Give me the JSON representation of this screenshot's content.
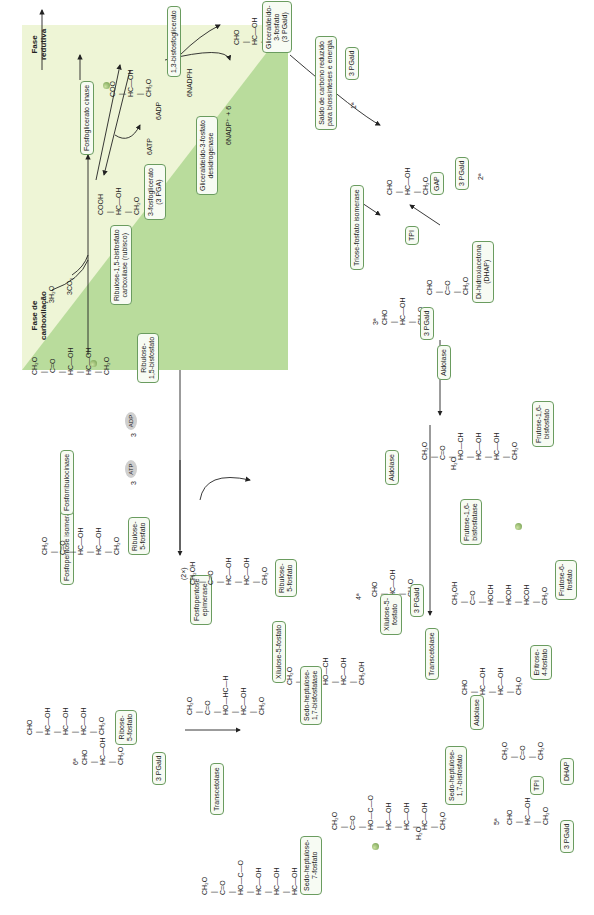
{
  "phases": {
    "carboxylation": "Fase de\ncarboxilação",
    "reduction": "Fase\nredutiva"
  },
  "enzymes": {
    "rubisco": "Ribulose-1,5-bisfosfato\ncarboxilase (rubisco)",
    "phosphoglycerate_kinase": "Fosfoglicerato cinase",
    "gapdh": "Gliceraldeído-3-fosfato\ndesidrogenase",
    "tpi_full": "Triose-fosfato isomerase",
    "tpi": "TPI",
    "tpi_2": "TPI",
    "aldolase_1": "Aldolase",
    "aldolase_2": "Aldolase",
    "aldolase_3": "Aldolase",
    "fbpase": "Frutose-1,6-\nbisfosfatase",
    "transketolase_1": "Transcetolase",
    "transketolase_2": "Transcetolase",
    "sbpase": "Sedo-heptulose-\n1,7-bisfosfatase",
    "epimerase": "Fosfopentose\nepimerase",
    "isomerase": "Fosfopentose isomerase",
    "phosphoribulokinase": "Fosforribulocinase"
  },
  "compounds": {
    "rubp": "Ribulose-\n1,5-bisfosfato",
    "pga": "3-fosfoglicerato\n(3 PGA)",
    "bpg": "1,3-bisfosfoglicerato",
    "g3p": "Gliceraldeído-\n3-fosfato\n(3 PGald)",
    "output": "Saldo de carbono reduzido\npara biossínteses e energia",
    "pgald_1": "3 PGald",
    "pgald_2": "3 PGald",
    "pgald_3": "3 PGald",
    "pgald_4": "3 PGald",
    "pgald_5": "3 PGald",
    "pgald_6": "3 PGald",
    "gap": "GAP",
    "dhap_full": "Di-hidroxiacetona\n(DHAP)",
    "dhap": "DHAP",
    "fbp": "Frutose-1,6-\nbisfosfato",
    "f6p": "Frutose-6-\nfosfato",
    "e4p": "Eritrose-\n4-fosfato",
    "x5p_1": "Xilulose-5-\nfosfato",
    "x5p_2": "Xilulose-5-fosfato",
    "sbp": "Sedo-heptulose-\n1,7-bisfosfato",
    "s7p": "Sedo-heptulose-\n7-fosfato",
    "r5p": "Ribose-\n5-fosfato",
    "ru5p_1": "Ribulose-\n5-fosfato",
    "ru5p_2": "Ribulose-\n5-fosfato"
  },
  "cofactors": {
    "h2o_3": "3H₂O",
    "co2_3": "3CO₂",
    "atp6": "6ATP",
    "adp6": "6ADP",
    "nadph6": "6NADPH",
    "nadp6": "6NADP⁺ + 6",
    "atp": "ATP",
    "adp": "ADP",
    "atp_count": "3",
    "adp_count": "3",
    "h2o_a": "H₂O",
    "h2o_b": "H₂O",
    "times2": "(2×)"
  },
  "ordinals": {
    "o1": "1ª",
    "o2": "2ª",
    "o3": "3ª",
    "o4": "4ª",
    "o5": "5ª",
    "o6": "6ª"
  },
  "structures": {
    "rubp": "CH₂O\n |\n C=O\n |\nHC—OH\n |\nHC—OH\n |\nCH₂O",
    "pga": "COOH\n |\nHC—OH\n |\nCH₂O",
    "bpg": "COO\n |\nHC—OH\n |\nCH₂O",
    "g3p": "CHO\n |\nHC—OH\n |\nCH₂O",
    "gap": "CHO\n |\nHC—OH\n |\nCH₂O",
    "dhap": "CHO\n |\nC=O\n |\nCH₂O",
    "pgald3": "CHO\n |\nHC—OH\n |\nCH₂O",
    "fbp": "CH₂O\n |\nC=O\n |\nHO—CH\n |\nHC—OH\n |\nHC—OH\n |\nCH₂O",
    "f6p": "CH₂OH\n |\nC=O\n |\nHOCH\n |\nHCOH\n |\nHCOH\n |\nCH₂O",
    "pgald4": "CHO\n |\nHC—OH\n |\nCH₂O",
    "x5p": "CH₂O\n |\nC=O\n |\nHO—CH\n |\nHC—OH\n |\nCH₂OH",
    "e4p": "CHO\n |\nHC—OH\n |\nHC—OH\n |\nCH₂O",
    "dhap2": "CH₂O\n |\nC=O\n |\nCH₂O",
    "pgald5": "CHO\n |\nHC—OH\n |\nCH₂O",
    "sbp": "CH₂O\n |\nC=O\n |\nHO—C—O\n |\nHC—OH\n |\nHC—OH\n |\nHC—OH\n |\nCH₂O",
    "s7p": "CH₂O\n |\nC=O\n |\nHO—C—O\n |\nHC—OH\n |\nHC—OH\n |\nHC—OH\n |\nCH₂O",
    "x5p2": "CH₂O\n |\nC=O\n |\nHO—HC—H\n |\nHC—OH\n |\nCH₂O",
    "ru5p2": "CH₂OH\n |\nC=O\n |\nHC—OH\n |\nHC—OH\n |\nCH₂O",
    "ru5p1": "CH₂O\n |\nC=O\n |\nHC—OH\n |\nHC—OH\n |\nCH₂O",
    "r5p": "CHO\n |\nHC—OH\n |\nHC—OH\n |\nHC—OH\n |\nCH₂O",
    "pgald6": "CHO\n |\nHC—OH\n |\nCH₂O"
  }
}
